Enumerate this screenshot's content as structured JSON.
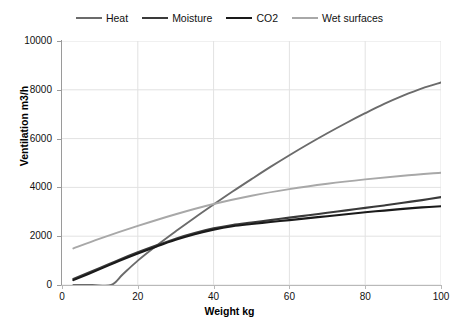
{
  "chart_data": {
    "type": "line",
    "title": "",
    "xlabel": "Weight kg",
    "ylabel": "Ventilation m3/h",
    "xlim": [
      0,
      100
    ],
    "ylim": [
      0,
      10000
    ],
    "xticks": [
      0,
      20,
      40,
      60,
      80,
      100
    ],
    "yticks": [
      0,
      2000,
      4000,
      6000,
      8000,
      10000
    ],
    "grid": true,
    "legend_position": "top-center",
    "series": [
      {
        "name": "Heat",
        "color": "#6b6b6b",
        "x": [
          3,
          8,
          13,
          16,
          20,
          25,
          30,
          35,
          40,
          45,
          50,
          55,
          60,
          65,
          70,
          75,
          80,
          85,
          90,
          95,
          100
        ],
        "y": [
          0,
          0,
          0,
          430,
          1000,
          1620,
          2200,
          2760,
          3300,
          3830,
          4340,
          4840,
          5320,
          5780,
          6220,
          6640,
          7040,
          7420,
          7760,
          8060,
          8300
        ]
      },
      {
        "name": "Moisture",
        "color": "#3a3a3a",
        "x": [
          3,
          10,
          15,
          20,
          25,
          30,
          35,
          40,
          45,
          50,
          55,
          60,
          65,
          70,
          75,
          80,
          85,
          90,
          95,
          100
        ],
        "y": [
          250,
          700,
          1030,
          1340,
          1630,
          1900,
          2130,
          2320,
          2460,
          2560,
          2660,
          2760,
          2860,
          2960,
          3060,
          3160,
          3260,
          3370,
          3480,
          3600
        ]
      },
      {
        "name": "CO2",
        "color": "#1a1a1a",
        "x": [
          3,
          10,
          15,
          20,
          25,
          30,
          35,
          40,
          45,
          50,
          55,
          60,
          65,
          70,
          75,
          80,
          85,
          90,
          95,
          100
        ],
        "y": [
          200,
          650,
          980,
          1290,
          1580,
          1850,
          2080,
          2270,
          2410,
          2500,
          2580,
          2660,
          2740,
          2820,
          2900,
          2980,
          3050,
          3120,
          3180,
          3230
        ]
      },
      {
        "name": "Wet surfaces",
        "color": "#a8a8a8",
        "x": [
          3,
          10,
          20,
          30,
          40,
          50,
          60,
          70,
          80,
          90,
          100
        ],
        "y": [
          1500,
          1900,
          2420,
          2900,
          3320,
          3660,
          3930,
          4150,
          4330,
          4480,
          4600
        ]
      }
    ]
  },
  "axes": {
    "y_tick_labels": [
      "10000",
      "8000",
      "6000",
      "4000",
      "2000",
      "0"
    ],
    "x_tick_labels": [
      "0",
      "20",
      "40",
      "60",
      "80",
      "100"
    ]
  },
  "style": {
    "grid_color": "#e2e2e2",
    "axis_color": "#9a9a9a",
    "background": "#ffffff"
  }
}
